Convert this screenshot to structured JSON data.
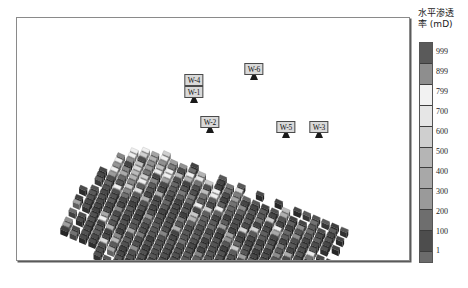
{
  "chart_data": {
    "type": "heatmap",
    "title_line1": "水平渗透",
    "title_line2": "率 (mD)",
    "colorbar_unit": "mD",
    "colorbar_ticks": [
      "999",
      "899",
      "799",
      "700",
      "600",
      "500",
      "400",
      "300",
      "200",
      "100",
      "1"
    ],
    "colorbar_colors": [
      "#5a5a5a",
      "#8e8e8e",
      "#f2f2f2",
      "#e6e6e6",
      "#cfcfcf",
      "#b5b5b5",
      "#a8a8a8",
      "#9a9a9a",
      "#6e6e6e",
      "#4d4d4d",
      "#6b6b6b"
    ],
    "value_range": [
      1,
      999
    ],
    "grid": false,
    "legend_position": "right",
    "xlabel": "",
    "ylabel": "",
    "wells": [
      {
        "label": "W-4",
        "x": 193,
        "y": 84
      },
      {
        "label": "W-1",
        "x": 193,
        "y": 96
      },
      {
        "label": "W-6",
        "x": 253,
        "y": 73
      },
      {
        "label": "W-2",
        "x": 209,
        "y": 126
      },
      {
        "label": "W-5",
        "x": 285,
        "y": 131
      },
      {
        "label": "W-3",
        "x": 318,
        "y": 131
      }
    ]
  },
  "panel": {
    "background": "#ffffff",
    "frame_color": "#8a8a8a"
  }
}
